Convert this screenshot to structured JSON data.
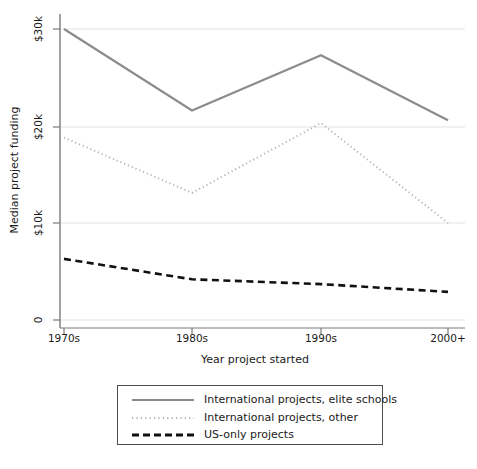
{
  "chart_data": {
    "type": "line",
    "title": "",
    "subtitle": "",
    "xlabel": "Year project started",
    "ylabel": "Median project funding",
    "categories": [
      "1970s",
      "1980s",
      "1990s",
      "2000+"
    ],
    "xticklabels": [
      "1970s",
      "1980s",
      "1990s",
      "2000+"
    ],
    "yticklabels": [
      "0",
      "$10k",
      "$20k",
      "$30k"
    ],
    "ytickvalues": [
      0,
      10000,
      20000,
      30000
    ],
    "ylim": [
      0,
      31000
    ],
    "grid": "horizontal",
    "legend_position": "below-outside",
    "series": [
      {
        "name": "International projects, elite schools",
        "style": "solid",
        "color": "#8c8c8c",
        "width": 2.2,
        "values": [
          30000,
          21600,
          27300,
          20600
        ]
      },
      {
        "name": "International projects, other",
        "style": "dotted",
        "color": "#b0b0b0",
        "width": 2.0,
        "values": [
          18800,
          13100,
          20300,
          10000
        ]
      },
      {
        "name": "US-only projects",
        "style": "dashed",
        "color": "#111111",
        "width": 2.6,
        "values": [
          6300,
          4200,
          3700,
          2900
        ]
      }
    ]
  },
  "legend": {
    "entries": [
      {
        "label": "International projects, elite schools"
      },
      {
        "label": "International projects, other"
      },
      {
        "label": "US-only projects"
      }
    ]
  },
  "colors": {
    "elite": "#8c8c8c",
    "other": "#b0b0b0",
    "usonly": "#111111",
    "grid": "#e0e0e0",
    "axis": "#666666",
    "text": "#1a1a1a",
    "background": "#ffffff"
  }
}
